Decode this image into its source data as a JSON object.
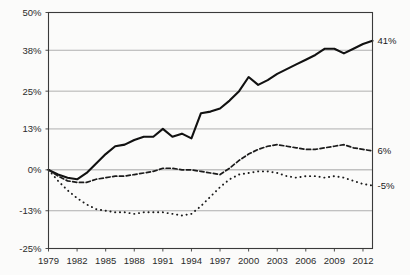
{
  "chart_data": {
    "type": "line",
    "title": "",
    "xlabel": "",
    "ylabel": "",
    "grid": true,
    "legend_position": "none",
    "xlim": [
      1979,
      2013
    ],
    "ylim": [
      -25,
      50
    ],
    "yticks": [
      "-25%",
      "-13%",
      "0%",
      "13%",
      "25%",
      "38%",
      "50%"
    ],
    "ytick_values": [
      -25,
      -13,
      0,
      13,
      25,
      38,
      50
    ],
    "xticks": [
      "1979",
      "1982",
      "1985",
      "1988",
      "1991",
      "1994",
      "1997",
      "2000",
      "2003",
      "2006",
      "2009",
      "2012"
    ],
    "xtick_values": [
      1979,
      1982,
      1985,
      1988,
      1991,
      1994,
      1997,
      2000,
      2003,
      2006,
      2009,
      2012
    ],
    "x": [
      1979,
      1980,
      1981,
      1982,
      1983,
      1984,
      1985,
      1986,
      1987,
      1988,
      1989,
      1990,
      1991,
      1992,
      1993,
      1994,
      1995,
      1996,
      1997,
      1998,
      1999,
      2000,
      2001,
      2002,
      2003,
      2004,
      2005,
      2006,
      2007,
      2008,
      2009,
      2010,
      2011,
      2012,
      2013
    ],
    "series": [
      {
        "name": "top",
        "style": "solid",
        "end_label": "41%",
        "end_value": 41,
        "values": [
          0,
          -1.5,
          -2.5,
          -3,
          -1,
          2,
          5,
          7.5,
          8,
          9.5,
          10.5,
          10.5,
          13,
          10.5,
          11.5,
          10,
          18,
          18.5,
          19.5,
          22,
          25,
          29.5,
          27,
          28.5,
          30.5,
          32,
          33.5,
          35,
          36.5,
          38.5,
          38.5,
          37,
          38.5,
          40,
          41
        ]
      },
      {
        "name": "middle",
        "style": "dashed",
        "end_label": "6%",
        "end_value": 6,
        "values": [
          0,
          -2,
          -3.5,
          -4,
          -4,
          -3,
          -2.5,
          -2,
          -2,
          -1.5,
          -1,
          -0.5,
          0.5,
          0.5,
          0,
          0,
          -0.5,
          -1,
          -1.5,
          0.5,
          3,
          5,
          6.5,
          7.5,
          8,
          7.5,
          7,
          6.5,
          6.5,
          7,
          7.5,
          8,
          7,
          6.5,
          6
        ]
      },
      {
        "name": "bottom",
        "style": "dotted",
        "end_label": "-5%",
        "end_value": -5,
        "values": [
          0,
          -3.5,
          -6.5,
          -9,
          -11,
          -12.5,
          -13,
          -13.5,
          -13.5,
          -14,
          -13.5,
          -13.5,
          -13.5,
          -14,
          -14.5,
          -14,
          -11.5,
          -8.5,
          -5.5,
          -3,
          -1.5,
          -1,
          -0.5,
          -0.5,
          -1,
          -2,
          -2.5,
          -2,
          -2,
          -2.5,
          -2,
          -2.5,
          -3.5,
          -4.5,
          -5
        ]
      }
    ]
  }
}
